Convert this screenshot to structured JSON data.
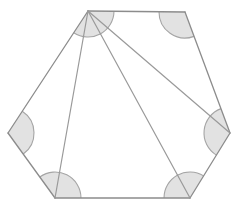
{
  "figure": {
    "type": "geometry-diagram",
    "shape_name": "hexagon",
    "canvas": {
      "width": 242,
      "height": 214
    },
    "colors": {
      "background": "#ffffff",
      "stroke": "#8c8c8c",
      "diagonal_stroke": "#9a9a9a",
      "arc_stroke": "#a5a5a5",
      "arc_fill": "#e2e2e2"
    },
    "stroke_widths": {
      "edge": 1.3,
      "diagonal": 1.2,
      "arc": 1.1
    },
    "vertices": [
      {
        "id": "A",
        "role": "apex",
        "x": 88,
        "y": 11
      },
      {
        "id": "B",
        "role": "top-right",
        "x": 185,
        "y": 12
      },
      {
        "id": "C",
        "role": "right",
        "x": 230,
        "y": 133
      },
      {
        "id": "D",
        "role": "bottom-right",
        "x": 190,
        "y": 198
      },
      {
        "id": "E",
        "role": "bottom-left",
        "x": 55,
        "y": 198
      },
      {
        "id": "F",
        "role": "left",
        "x": 8,
        "y": 133
      }
    ],
    "edges": [
      {
        "from": "A",
        "to": "B"
      },
      {
        "from": "B",
        "to": "C"
      },
      {
        "from": "C",
        "to": "D"
      },
      {
        "from": "D",
        "to": "E"
      },
      {
        "from": "E",
        "to": "F"
      },
      {
        "from": "F",
        "to": "A"
      }
    ],
    "diagonals": [
      {
        "from": "A",
        "to": "C"
      },
      {
        "from": "A",
        "to": "D"
      },
      {
        "from": "A",
        "to": "E"
      }
    ],
    "angle_arcs": [
      {
        "vertex": "A",
        "radius": 26,
        "shaded": true
      },
      {
        "vertex": "B",
        "radius": 26,
        "shaded": true
      },
      {
        "vertex": "C",
        "radius": 26,
        "shaded": true
      },
      {
        "vertex": "D",
        "radius": 26,
        "shaded": true
      },
      {
        "vertex": "E",
        "radius": 26,
        "shaded": true
      },
      {
        "vertex": "F",
        "radius": 26,
        "shaded": true
      }
    ],
    "triangles": [
      {
        "vertices": [
          "A",
          "B",
          "C"
        ]
      },
      {
        "vertices": [
          "A",
          "C",
          "D"
        ]
      },
      {
        "vertices": [
          "A",
          "D",
          "E"
        ]
      },
      {
        "vertices": [
          "A",
          "E",
          "F"
        ]
      }
    ]
  }
}
